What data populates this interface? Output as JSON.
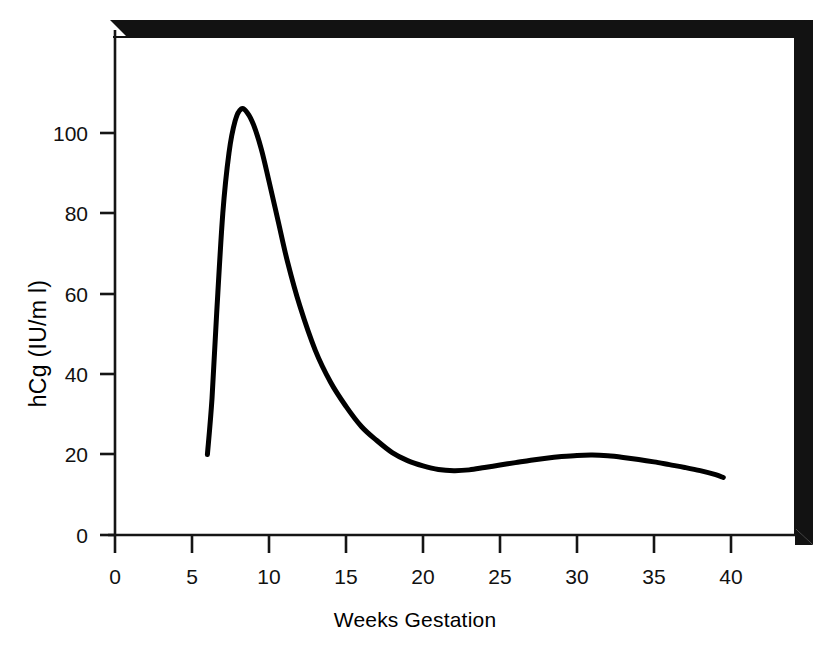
{
  "chart_data": {
    "type": "line",
    "title": "",
    "xlabel": "Weeks Gestation",
    "ylabel": "hCg (IU/m l)",
    "xlim": [
      0,
      44
    ],
    "ylim": [
      0,
      118
    ],
    "grid": false,
    "legend": null,
    "xticks": [
      "0",
      "5",
      "10",
      "15",
      "20",
      "25",
      "30",
      "35",
      "40"
    ],
    "xtick_values": [
      0,
      5,
      10,
      15,
      20,
      25,
      30,
      35,
      40
    ],
    "yticks": [
      "0",
      "20",
      "40",
      "60",
      "80",
      "100"
    ],
    "ytick_values": [
      0,
      20,
      40,
      60,
      80,
      100
    ],
    "series": [
      {
        "name": "hCg",
        "color": "#000000",
        "x": [
          6.0,
          6.3,
          6.6,
          7.0,
          7.4,
          7.8,
          8.2,
          8.6,
          9.0,
          9.5,
          10.0,
          10.6,
          11.2,
          12.0,
          13.0,
          14.0,
          15.0,
          16.0,
          17.0,
          18.0,
          19.0,
          20.0,
          21.0,
          22.0,
          23.0,
          24.0,
          25.0,
          26.0,
          27.0,
          28.0,
          29.0,
          30.0,
          31.0,
          32.0,
          33.0,
          34.0,
          35.0,
          36.0,
          37.0,
          38.0,
          39.0,
          39.5
        ],
        "y": [
          20.0,
          34.0,
          55.0,
          80.0,
          95.0,
          103.0,
          106.0,
          105.0,
          102.0,
          96.0,
          88.0,
          78.0,
          68.0,
          57.0,
          46.0,
          38.0,
          32.0,
          27.0,
          23.5,
          20.5,
          18.5,
          17.2,
          16.3,
          16.0,
          16.2,
          16.8,
          17.4,
          18.0,
          18.6,
          19.1,
          19.5,
          19.8,
          19.9,
          19.7,
          19.3,
          18.8,
          18.2,
          17.5,
          16.8,
          16.0,
          15.0,
          14.3
        ]
      }
    ],
    "annotations": {
      "peak_week": 8,
      "peak_value": 106,
      "trough_week": 22,
      "trough_value": 16,
      "secondary_peak_week": 31,
      "secondary_peak_value": 20,
      "start_week": 6,
      "start_value": 20,
      "end_week": 39.5,
      "end_value": 14
    },
    "style": {
      "curve_color": "#0d0d0d",
      "curve_width": 5,
      "axis_color": "#111111",
      "frame_color": "#111111",
      "background": "#ffffff"
    }
  }
}
